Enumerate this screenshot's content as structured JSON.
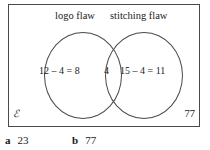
{
  "diagram": {
    "type": "venn",
    "universal_set_symbol": "ℰ",
    "outside_count": "77",
    "sets": [
      {
        "label": "logo flaw",
        "region_text": "12 – 4 = 8"
      },
      {
        "label": "stitching flaw",
        "region_text": "15 – 4 = 11"
      }
    ],
    "intersection_text": "4"
  },
  "answers": [
    {
      "key": "a",
      "value": "23"
    },
    {
      "key": "b",
      "value": "77"
    }
  ]
}
